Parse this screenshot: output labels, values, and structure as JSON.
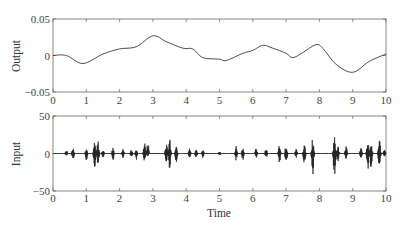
{
  "chart_data": [
    {
      "type": "line",
      "title": "",
      "xlabel": "",
      "ylabel": "Output",
      "xlim": [
        0,
        10
      ],
      "ylim": [
        -0.05,
        0.05
      ],
      "xticks": [
        "0",
        "1",
        "2",
        "3",
        "4",
        "5",
        "6",
        "7",
        "8",
        "9",
        "10"
      ],
      "yticks": [
        "0.05",
        "0",
        "-0.05"
      ],
      "grid": false,
      "legend": null,
      "series": [
        {
          "name": "Output",
          "x": [
            0,
            0.4,
            0.9,
            1.5,
            2.0,
            2.5,
            3.0,
            3.4,
            3.9,
            4.2,
            4.5,
            5.0,
            5.2,
            5.7,
            6.0,
            6.3,
            6.6,
            7.0,
            7.2,
            7.5,
            7.9,
            8.1,
            8.5,
            9.0,
            9.5,
            10.0
          ],
          "y": [
            0.0,
            0.0,
            -0.011,
            0.002,
            0.009,
            0.012,
            0.027,
            0.019,
            0.01,
            0.009,
            -0.003,
            -0.005,
            -0.007,
            0.003,
            0.007,
            0.014,
            0.01,
            0.003,
            -0.003,
            0.004,
            0.015,
            0.01,
            -0.012,
            -0.023,
            -0.008,
            0.002
          ]
        }
      ]
    },
    {
      "type": "line",
      "title": "",
      "xlabel": "Time",
      "ylabel": "Input",
      "xlim": [
        0,
        10
      ],
      "ylim": [
        -50,
        50
      ],
      "xticks": [
        "0",
        "1",
        "2",
        "3",
        "4",
        "5",
        "6",
        "7",
        "8",
        "9",
        "10"
      ],
      "yticks": [
        "50",
        "0",
        "-50"
      ],
      "grid": false,
      "legend": null,
      "description": "Sparse bursty noise signal; bursts listed as [time, positive peak, negative peak]",
      "bursts": [
        [
          0.4,
          5,
          -4
        ],
        [
          0.6,
          9,
          -10
        ],
        [
          1.0,
          8,
          -10
        ],
        [
          1.25,
          17,
          -19
        ],
        [
          1.35,
          18,
          -17
        ],
        [
          1.5,
          6,
          -6
        ],
        [
          1.8,
          8,
          -9
        ],
        [
          2.1,
          7,
          -6
        ],
        [
          2.35,
          6,
          -7
        ],
        [
          2.5,
          6,
          -9
        ],
        [
          2.75,
          16,
          -13
        ],
        [
          2.85,
          18,
          -4
        ],
        [
          3.4,
          17,
          -15
        ],
        [
          3.5,
          22,
          -23
        ],
        [
          3.7,
          10,
          -14
        ],
        [
          4.1,
          7,
          -6
        ],
        [
          4.3,
          6,
          -7
        ],
        [
          4.5,
          6,
          -6
        ],
        [
          5.0,
          3,
          -3
        ],
        [
          5.5,
          10,
          -10
        ],
        [
          5.7,
          8,
          -9
        ],
        [
          6.1,
          7,
          -6
        ],
        [
          6.4,
          7,
          -7
        ],
        [
          6.8,
          12,
          -14
        ],
        [
          7.0,
          13,
          -18
        ],
        [
          7.3,
          7,
          -6
        ],
        [
          7.55,
          13,
          -18
        ],
        [
          7.8,
          23,
          -32
        ],
        [
          8.45,
          25,
          -40
        ],
        [
          8.55,
          14,
          -14
        ],
        [
          8.8,
          12,
          -10
        ],
        [
          9.25,
          10,
          -9
        ],
        [
          9.45,
          20,
          -25
        ],
        [
          9.55,
          19,
          -22
        ],
        [
          9.8,
          22,
          -28
        ],
        [
          9.95,
          5,
          -5
        ]
      ]
    }
  ],
  "figure": {
    "top_ylabel": "Output",
    "bottom_ylabel": "Input",
    "xlabel": "Time",
    "top_yticks": [
      "0.05",
      "0",
      "-0.05"
    ],
    "bottom_yticks": [
      "50",
      "0",
      "-50"
    ],
    "xticks": [
      "0",
      "1",
      "2",
      "3",
      "4",
      "5",
      "6",
      "7",
      "8",
      "9",
      "10"
    ],
    "line_color": "#3a3a3a",
    "axis_color": "#666666"
  }
}
